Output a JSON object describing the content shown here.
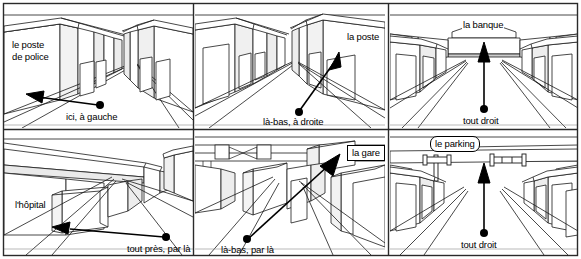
{
  "figure": {
    "rows": 2,
    "cols": 3,
    "width": 581,
    "height": 259,
    "line_color": "#1a1a1a",
    "shade_color": "#b9b9b9",
    "background": "#ffffff"
  },
  "panels": [
    {
      "id": "panel-poste-de-police",
      "index": 0,
      "row": 0,
      "col": 0,
      "destination_label": "le poste\nde police",
      "destination_label_line1": "le poste",
      "destination_label_line2": "de police",
      "direction_label": "ici, à gauche",
      "arrow_direction": "left",
      "label_style": "plain"
    },
    {
      "id": "panel-la-poste",
      "index": 1,
      "row": 0,
      "col": 1,
      "destination_label": "la poste",
      "direction_label": "là-bas, à droite",
      "arrow_direction": "upper-right",
      "label_style": "plain"
    },
    {
      "id": "panel-la-banque",
      "index": 2,
      "row": 0,
      "col": 2,
      "destination_label": "la banque",
      "direction_label": "tout droit",
      "arrow_direction": "up",
      "label_style": "plain"
    },
    {
      "id": "panel-l-hopital",
      "index": 3,
      "row": 1,
      "col": 0,
      "destination_label": "l'hôpital",
      "direction_label": "tout près, par là",
      "arrow_direction": "left",
      "label_style": "plain"
    },
    {
      "id": "panel-la-gare",
      "index": 4,
      "row": 1,
      "col": 1,
      "destination_label": "la gare",
      "direction_label": "là-bas, par là",
      "arrow_direction": "upper-right",
      "label_style": "box"
    },
    {
      "id": "panel-le-parking",
      "index": 5,
      "row": 1,
      "col": 2,
      "destination_label": "le parking",
      "direction_label": "tout droit",
      "arrow_direction": "up",
      "label_style": "rounded-box"
    }
  ]
}
